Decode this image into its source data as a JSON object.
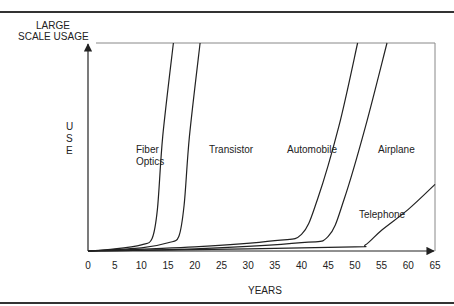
{
  "figure": {
    "y_axis_title_lines": [
      "LARGE",
      "SCALE USAGE"
    ],
    "y_axis_label_letters": [
      "U",
      "S",
      "E"
    ],
    "x_axis_title": "YEARS"
  },
  "chart_data": {
    "type": "line",
    "title": "",
    "xlabel": "YEARS",
    "ylabel": "USE",
    "y_top_label": "LARGE SCALE USAGE",
    "xlim": [
      0,
      65
    ],
    "ylim": [
      0,
      100
    ],
    "x_ticks": [
      "0",
      "5",
      "10",
      "15",
      "20",
      "25",
      "30",
      "35",
      "40",
      "45",
      "50",
      "55",
      "60",
      "65"
    ],
    "grid": false,
    "legend": "inline labels",
    "series": [
      {
        "name": "Fiber Optics",
        "label_lines": [
          "Fiber",
          "Optics"
        ],
        "points": [
          [
            0,
            0
          ],
          [
            5,
            1
          ],
          [
            10,
            3
          ],
          [
            12,
            6
          ],
          [
            13,
            20
          ],
          [
            14,
            55
          ],
          [
            16,
            100
          ]
        ]
      },
      {
        "name": "Transistor",
        "label_lines": [
          "Transistor"
        ],
        "points": [
          [
            0,
            0
          ],
          [
            10,
            1.5
          ],
          [
            15,
            4
          ],
          [
            17,
            7
          ],
          [
            18,
            22
          ],
          [
            19,
            55
          ],
          [
            21,
            100
          ]
        ]
      },
      {
        "name": "Automobile",
        "label_lines": [
          "Automobile"
        ],
        "points": [
          [
            0,
            0
          ],
          [
            20,
            2
          ],
          [
            35,
            5
          ],
          [
            40,
            8
          ],
          [
            43,
            25
          ],
          [
            47,
            60
          ],
          [
            50.5,
            100
          ]
        ]
      },
      {
        "name": "Airplane",
        "label_lines": [
          "Airplane"
        ],
        "points": [
          [
            0,
            0
          ],
          [
            20,
            1
          ],
          [
            40,
            4
          ],
          [
            45,
            7
          ],
          [
            48,
            25
          ],
          [
            52,
            60
          ],
          [
            56,
            100
          ]
        ]
      },
      {
        "name": "Telephone",
        "label_lines": [
          "Telephone"
        ],
        "points": [
          [
            0,
            0
          ],
          [
            30,
            1
          ],
          [
            50,
            2
          ],
          [
            52,
            3
          ],
          [
            55,
            10
          ],
          [
            60,
            20
          ],
          [
            65,
            32
          ]
        ]
      }
    ]
  }
}
